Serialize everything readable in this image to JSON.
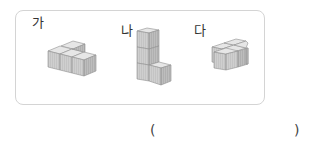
{
  "problem": {
    "figures": [
      {
        "label": "가",
        "cubes": 5,
        "description": "front row of 3 cubes with 2 cubes behind on the left"
      },
      {
        "label": "나",
        "cubes": 4,
        "description": "stack of 3 cubes with 1 cube at bottom right"
      },
      {
        "label": "다",
        "cubes": 5,
        "description": "2x2 block of cubes with extra cube layered"
      }
    ],
    "answer": {
      "open_paren": "(",
      "close_paren": ")",
      "value": ""
    }
  },
  "colors": {
    "border": "#d4d4d4",
    "cube_top": "#e6e6e6",
    "cube_front": "#cfcfcf",
    "cube_side": "#b8b8b8",
    "cube_edge": "#8f8f8f"
  }
}
